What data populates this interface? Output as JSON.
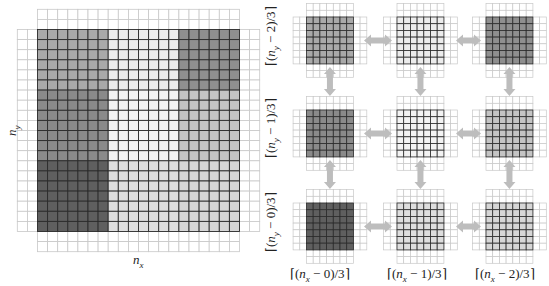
{
  "diagram": {
    "left_panel": {
      "x_label": "n_x",
      "y_label": "n_y",
      "grid": {
        "cols": 20,
        "rows": 20,
        "halo": 2
      },
      "regions": [
        {
          "name": "top-left",
          "col_block": 0,
          "row_block": 0,
          "shade": "#a9a9a9"
        },
        {
          "name": "top-middle",
          "col_block": 1,
          "row_block": 0,
          "shade": "#ececec"
        },
        {
          "name": "top-right",
          "col_block": 2,
          "row_block": 0,
          "shade": "#8f8f8f"
        },
        {
          "name": "middle-left",
          "col_block": 0,
          "row_block": 1,
          "shade": "#8a8a8a"
        },
        {
          "name": "middle-middle",
          "col_block": 1,
          "row_block": 1,
          "shade": "#f3f3f3"
        },
        {
          "name": "middle-right",
          "col_block": 2,
          "row_block": 1,
          "shade": "#c4c4c4"
        },
        {
          "name": "bottom-left",
          "col_block": 0,
          "row_block": 2,
          "shade": "#5f5f5f"
        },
        {
          "name": "bottom-middle",
          "col_block": 1,
          "row_block": 2,
          "shade": "#dedede"
        },
        {
          "name": "bottom-right",
          "col_block": 2,
          "row_block": 2,
          "shade": "#d6d6d6"
        }
      ]
    },
    "right_panel": {
      "row_labels": [
        {
          "prefix": "⌈(",
          "var": "n",
          "sub": "y",
          "suffix": " − 2)/3⌉"
        },
        {
          "prefix": "⌈(",
          "var": "n",
          "sub": "y",
          "suffix": " − 1)/3⌉"
        },
        {
          "prefix": "⌈(",
          "var": "n",
          "sub": "y",
          "suffix": " − 0)/3⌉"
        }
      ],
      "col_labels": [
        {
          "prefix": "⌈(",
          "var": "n",
          "sub": "x",
          "suffix": " − 0)/3⌉"
        },
        {
          "prefix": "⌈(",
          "var": "n",
          "sub": "x",
          "suffix": " − 1)/3⌉"
        },
        {
          "prefix": "⌈(",
          "var": "n",
          "sub": "x",
          "suffix": " − 2)/3⌉"
        }
      ],
      "blocks": [
        {
          "row": 0,
          "col": 0,
          "shade": "#a9a9a9"
        },
        {
          "row": 0,
          "col": 1,
          "shade": "#ececec"
        },
        {
          "row": 0,
          "col": 2,
          "shade": "#8f8f8f"
        },
        {
          "row": 1,
          "col": 0,
          "shade": "#8a8a8a"
        },
        {
          "row": 1,
          "col": 1,
          "shade": "#f3f3f3"
        },
        {
          "row": 1,
          "col": 2,
          "shade": "#c4c4c4"
        },
        {
          "row": 2,
          "col": 0,
          "shade": "#5f5f5f"
        },
        {
          "row": 2,
          "col": 1,
          "shade": "#dedede"
        },
        {
          "row": 2,
          "col": 2,
          "shade": "#d6d6d6"
        }
      ],
      "block_interior_cells": 7,
      "block_halo_cells": 2,
      "arrow_color": "#bdbdbd"
    },
    "colors": {
      "grid_line_dark": "#2b2b2b",
      "grid_line_light": "#c8c8c8",
      "background": "#ffffff"
    }
  }
}
